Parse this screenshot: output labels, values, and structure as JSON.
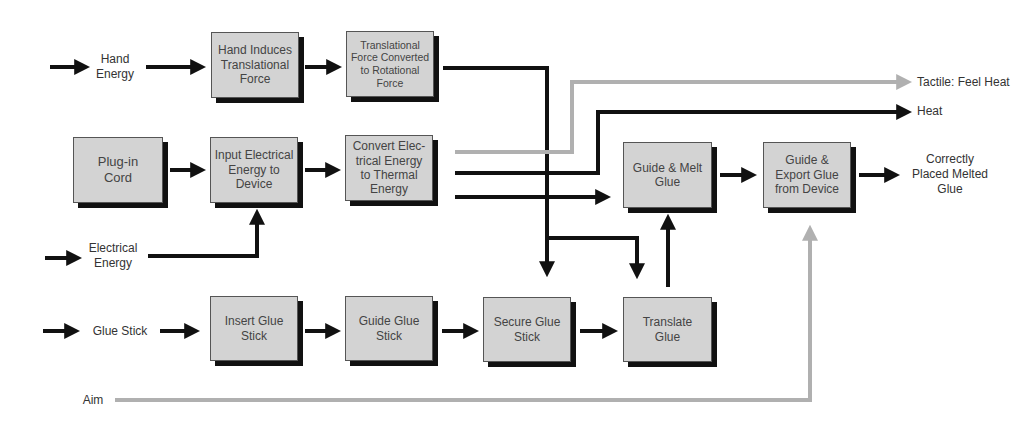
{
  "diagram": {
    "type": "functional-flow-diagram",
    "colors": {
      "box_fill": "#d3d3d3",
      "box_shadow": "#111111",
      "energy_flow": "#111111",
      "signal_flow": "#b0b0b0",
      "background": "#ffffff"
    },
    "inputs": {
      "hand_energy": "Hand\nEnergy",
      "electrical_energy": "Electrical\nEnergy",
      "glue_stick": "Glue Stick",
      "aim": "Aim"
    },
    "outputs": {
      "tactile": "Tactile: Feel Heat",
      "heat": "Heat",
      "placed_glue": "Correctly\nPlaced Melted\nGlue"
    },
    "boxes": {
      "hand_induces": "Hand Induces Translational Force",
      "translational_converted": "Translational Force Converted to Rotational Force",
      "plug_in_cord": "Plug-in Cord",
      "input_electrical": "Input Electrical Energy to Device",
      "convert_electrical": "Convert Electrical Energy to Thermal Energy",
      "guide_melt": "Guide & Melt Glue",
      "guide_export": "Guide & Export Glue from Device",
      "insert_glue": "Insert Glue Stick",
      "guide_glue_stick": "Guide Glue Stick",
      "secure_glue": "Secure Glue Stick",
      "translate_glue": "Translate Glue"
    },
    "box_display": {
      "hand_induces": "Hand Induces\nTranslational\nForce",
      "translational_converted": "Translational\nForce Converted\nto Rotational\nForce",
      "plug_in_cord": "Plug-in\nCord",
      "input_electrical": "Input Electrical\nEnergy to\nDevice",
      "convert_electrical": "Convert Elec-\ntrical Energy\nto Thermal\nEnergy",
      "guide_melt": "Guide & Melt\nGlue",
      "guide_export": "Guide &\nExport Glue\nfrom Device",
      "insert_glue": "Insert Glue\nStick",
      "guide_glue_stick": "Guide Glue\nStick",
      "secure_glue": "Secure Glue\nStick",
      "translate_glue": "Translate\nGlue"
    },
    "edges": [
      {
        "from": "Hand Energy",
        "to": "Hand Induces Translational Force",
        "type": "energy"
      },
      {
        "from": "Hand Induces Translational Force",
        "to": "Translational Force Converted to Rotational Force",
        "type": "energy"
      },
      {
        "from": "Translational Force Converted to Rotational Force",
        "to": "Secure Glue Stick",
        "type": "energy"
      },
      {
        "from": "Translational Force Converted to Rotational Force",
        "to": "Translate Glue",
        "type": "energy"
      },
      {
        "from": "Plug-in Cord",
        "to": "Input Electrical Energy to Device",
        "type": "energy"
      },
      {
        "from": "Electrical Energy",
        "to": "Input Electrical Energy to Device",
        "type": "energy"
      },
      {
        "from": "Input Electrical Energy to Device",
        "to": "Convert Electrical Energy to Thermal Energy",
        "type": "energy"
      },
      {
        "from": "Convert Electrical Energy to Thermal Energy",
        "to": "Tactile: Feel Heat",
        "type": "signal"
      },
      {
        "from": "Convert Electrical Energy to Thermal Energy",
        "to": "Heat",
        "type": "energy"
      },
      {
        "from": "Convert Electrical Energy to Thermal Energy",
        "to": "Guide & Melt Glue",
        "type": "energy"
      },
      {
        "from": "Translate Glue",
        "to": "Guide & Melt Glue",
        "type": "energy"
      },
      {
        "from": "Guide & Melt Glue",
        "to": "Guide & Export Glue from Device",
        "type": "energy"
      },
      {
        "from": "Guide & Export Glue from Device",
        "to": "Correctly Placed Melted Glue",
        "type": "energy"
      },
      {
        "from": "Glue Stick",
        "to": "Insert Glue Stick",
        "type": "material"
      },
      {
        "from": "Insert Glue Stick",
        "to": "Guide Glue Stick",
        "type": "material"
      },
      {
        "from": "Guide Glue Stick",
        "to": "Secure Glue Stick",
        "type": "material"
      },
      {
        "from": "Secure Glue Stick",
        "to": "Translate Glue",
        "type": "material"
      },
      {
        "from": "Aim",
        "to": "Guide & Export Glue from Device",
        "type": "signal"
      }
    ]
  }
}
